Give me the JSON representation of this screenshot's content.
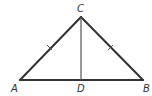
{
  "diagram": {
    "stroke_color": "#333333",
    "points": {
      "A": {
        "label": "A",
        "x": 20,
        "y": 80,
        "label_x": 12,
        "label_y": 92
      },
      "B": {
        "label": "B",
        "x": 143,
        "y": 80,
        "label_x": 144,
        "label_y": 92
      },
      "C": {
        "label": "C",
        "x": 81,
        "y": 17,
        "label_x": 77,
        "label_y": 12
      },
      "D": {
        "label": "D",
        "x": 81,
        "y": 80,
        "label_x": 77,
        "label_y": 92
      }
    },
    "segments": [
      {
        "from": "A",
        "to": "C",
        "tick_marks": 1
      },
      {
        "from": "C",
        "to": "B",
        "tick_marks": 1
      },
      {
        "from": "A",
        "to": "B",
        "tick_marks": 0
      },
      {
        "from": "C",
        "to": "D",
        "tick_marks": 0
      }
    ]
  }
}
